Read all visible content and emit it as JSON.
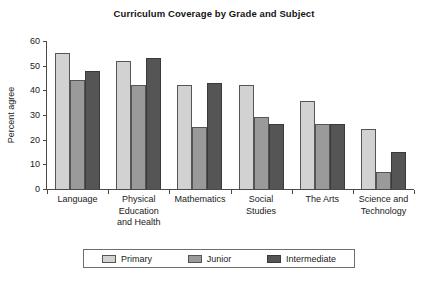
{
  "chart_data": {
    "type": "bar",
    "title": "Curriculum Coverage by Grade and Subject",
    "xlabel": "",
    "ylabel": "Percent agree",
    "ylim": [
      0,
      60
    ],
    "yticks": [
      0,
      10,
      20,
      30,
      40,
      50,
      60
    ],
    "grid": false,
    "legend_position": "bottom",
    "categories": [
      "Language",
      "Physical Education and Health",
      "Mathematics",
      "Social Studies",
      "The Arts",
      "Science and Technology"
    ],
    "category_lines": [
      [
        "Language"
      ],
      [
        "Physical",
        "Education",
        "and Health"
      ],
      [
        "Mathematics"
      ],
      [
        "Social",
        "Studies"
      ],
      [
        "The Arts"
      ],
      [
        "Science and",
        "Technology"
      ]
    ],
    "series": [
      {
        "name": "Primary",
        "color": "#d2d2d2",
        "values": [
          55,
          52,
          42,
          42,
          35.5,
          24.5
        ]
      },
      {
        "name": "Junior",
        "color": "#9a9a9a",
        "values": [
          44,
          42,
          25,
          29,
          26.5,
          7
        ]
      },
      {
        "name": "Intermediate",
        "color": "#555555",
        "values": [
          48,
          53,
          43,
          26.5,
          26.5,
          15
        ]
      }
    ]
  },
  "legend": {
    "items": [
      {
        "label": "Primary"
      },
      {
        "label": "Junior"
      },
      {
        "label": "Intermediate"
      }
    ]
  }
}
